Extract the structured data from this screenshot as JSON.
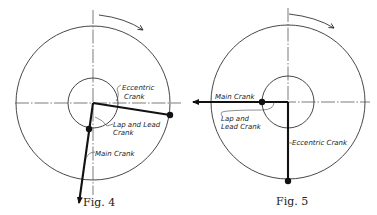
{
  "figures": [
    {
      "id": "fig4",
      "caption": "Fig. 4",
      "labels": {
        "eccentric_crank_line1": "Eccentric",
        "eccentric_crank_line2": "Crank",
        "lap_lead_line1": "Lap and Lead",
        "lap_lead_line2": "Crank",
        "main_crank": "Main Crank"
      },
      "rotation": "clockwise"
    },
    {
      "id": "fig5",
      "caption": "Fig. 5",
      "labels": {
        "main_crank": "Main Crank",
        "lap_lead_line1": "Lap and",
        "lap_lead_line2": "Lead Crank",
        "eccentric_crank": "Eccentric Crank"
      },
      "rotation": "clockwise"
    }
  ],
  "colors": {
    "ink": "#111111",
    "background": "#ffffff"
  }
}
